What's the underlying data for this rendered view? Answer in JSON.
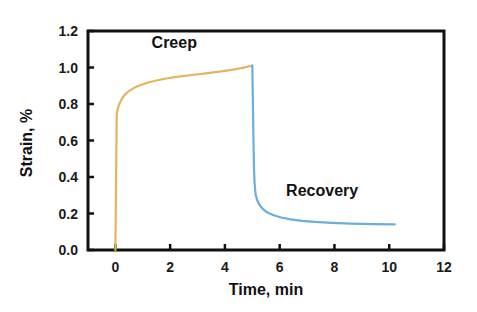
{
  "chart_data": {
    "type": "line",
    "title": "",
    "xlabel": "Time, min",
    "ylabel": "Strain, %",
    "xlim": [
      -1,
      12
    ],
    "ylim": [
      0.0,
      1.2
    ],
    "xticks": [
      0,
      2,
      4,
      6,
      8,
      10,
      12
    ],
    "xtick_labels": [
      "0",
      "2",
      "4",
      "6",
      "8",
      "10",
      "12"
    ],
    "yticks": [
      0.0,
      0.2,
      0.4,
      0.6,
      0.8,
      1.0,
      1.2
    ],
    "ytick_labels": [
      "0.0",
      "0.2",
      "0.4",
      "0.6",
      "0.8",
      "1.0",
      "1.2"
    ],
    "grid": false,
    "legend": "none",
    "frame": "box",
    "background": "#ffffff",
    "axis_color": "#111111",
    "series": [
      {
        "name": "Creep",
        "color": "#E5B45C",
        "width": 2.2,
        "points": [
          [
            0.0,
            0.0
          ],
          [
            0.02,
            0.3
          ],
          [
            0.04,
            0.6
          ],
          [
            0.05,
            0.745
          ],
          [
            0.08,
            0.77
          ],
          [
            0.12,
            0.79
          ],
          [
            0.18,
            0.812
          ],
          [
            0.25,
            0.832
          ],
          [
            0.35,
            0.852
          ],
          [
            0.5,
            0.872
          ],
          [
            0.7,
            0.89
          ],
          [
            0.9,
            0.903
          ],
          [
            1.2,
            0.918
          ],
          [
            1.5,
            0.929
          ],
          [
            1.9,
            0.941
          ],
          [
            2.3,
            0.95
          ],
          [
            2.8,
            0.959
          ],
          [
            3.3,
            0.968
          ],
          [
            3.8,
            0.977
          ],
          [
            4.3,
            0.988
          ],
          [
            4.7,
            0.999
          ],
          [
            4.92,
            1.008
          ],
          [
            5.0,
            1.01
          ]
        ]
      },
      {
        "name": "Recovery",
        "color": "#6BAEDB",
        "width": 2.2,
        "points": [
          [
            5.0,
            1.01
          ],
          [
            5.02,
            0.82
          ],
          [
            5.04,
            0.62
          ],
          [
            5.06,
            0.46
          ],
          [
            5.08,
            0.37
          ],
          [
            5.12,
            0.305
          ],
          [
            5.18,
            0.272
          ],
          [
            5.26,
            0.248
          ],
          [
            5.38,
            0.225
          ],
          [
            5.55,
            0.205
          ],
          [
            5.78,
            0.19
          ],
          [
            6.05,
            0.178
          ],
          [
            6.4,
            0.168
          ],
          [
            6.8,
            0.16
          ],
          [
            7.3,
            0.154
          ],
          [
            7.9,
            0.149
          ],
          [
            8.6,
            0.145
          ],
          [
            9.4,
            0.142
          ],
          [
            10.2,
            0.14
          ]
        ]
      }
    ],
    "annotations": [
      {
        "text": "Creep",
        "x": 2.15,
        "y": 1.135,
        "color": "#111111"
      },
      {
        "text": "Recovery",
        "x": 7.55,
        "y": 0.325,
        "color": "#111111"
      }
    ]
  }
}
